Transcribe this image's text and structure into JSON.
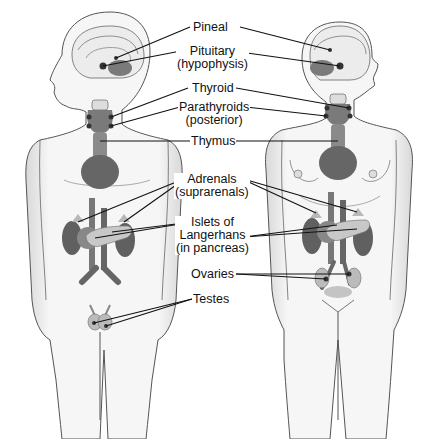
{
  "figure": {
    "figures": [
      {
        "name": "male",
        "side": "left"
      },
      {
        "name": "female",
        "side": "right"
      }
    ],
    "colors": {
      "body_fill": "#f4f4f4",
      "outline": "#555555",
      "organ_dark": "#5e5e5e",
      "organ_mid": "#8a8a8a",
      "organ_light": "#c4c4c4",
      "leader_line": "#111111"
    }
  },
  "labels": {
    "pineal": "Pineal",
    "pituitary_1": "Pituitary",
    "pituitary_2": "(hypophysis)",
    "thyroid": "Thyroid",
    "parathyroids_1": "Parathyroids",
    "parathyroids_2": "(posterior)",
    "thymus": "Thymus",
    "adrenals_1": "Adrenals",
    "adrenals_2": "(suprarenals)",
    "islets_1": "Islets of",
    "islets_2": "Langerhans",
    "islets_3": "(in pancreas)",
    "ovaries": "Ovaries",
    "testes": "Testes"
  }
}
